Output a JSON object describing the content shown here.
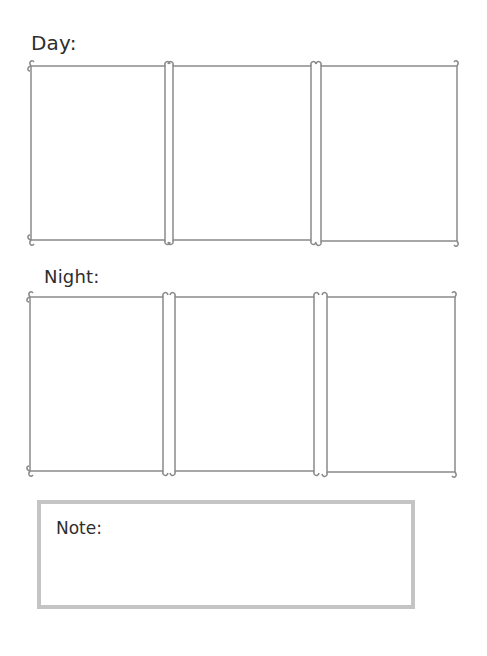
{
  "sections": {
    "day": {
      "label": "Day:",
      "panel_count": 3
    },
    "night": {
      "label": "Night:",
      "panel_count": 3
    }
  },
  "note": {
    "label": "Note:"
  },
  "colors": {
    "panel_stroke": "#8a8a8a",
    "note_border": "#c4c4c4",
    "text": "#2e2e2e"
  }
}
